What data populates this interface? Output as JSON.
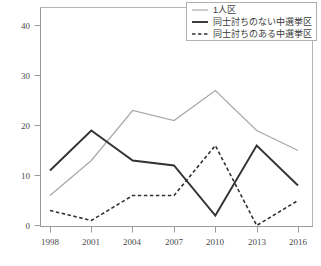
{
  "chart_data": {
    "type": "line",
    "title": "",
    "xlabel": "",
    "ylabel": "",
    "categories": [
      "1998",
      "2001",
      "2004",
      "2007",
      "2010",
      "2013",
      "2016"
    ],
    "ylim": [
      0,
      42
    ],
    "yticks": [
      0,
      10,
      20,
      30,
      40
    ],
    "grid": false,
    "legend_position": "top-right",
    "series": [
      {
        "name": "1人区",
        "style": "solid-light",
        "color": "#a8a8a8",
        "values": [
          6,
          13,
          23,
          21,
          27,
          19,
          15
        ]
      },
      {
        "name": "同士討ちのない中選挙区",
        "style": "solid-dark",
        "color": "#333333",
        "values": [
          11,
          19,
          13,
          12,
          2,
          16,
          8
        ]
      },
      {
        "name": "同士討ちのある中選挙区",
        "style": "dashed-dark",
        "color": "#333333",
        "values": [
          3,
          1,
          6,
          6,
          16,
          0,
          5
        ]
      }
    ]
  },
  "axes": {
    "y_tick_labels": [
      "40",
      "30",
      "20",
      "10",
      "0"
    ],
    "x_tick_labels": [
      "1998",
      "2001",
      "2004",
      "2007",
      "2010",
      "2013",
      "2016"
    ]
  },
  "legend": {
    "entries": [
      {
        "label": "1人区",
        "swatch": "solid-light"
      },
      {
        "label": "同士討ちのない中選挙区",
        "swatch": "solid-dark"
      },
      {
        "label": "同士討ちのある中選挙区",
        "swatch": "dashed-dark"
      }
    ]
  },
  "footnote": {
    "text": ""
  },
  "colors": {
    "series_light": "#a8a8a8",
    "series_dark": "#333333",
    "axis": "#9a9a9a",
    "frame": "#b5b5b5",
    "background": "#ffffff"
  }
}
